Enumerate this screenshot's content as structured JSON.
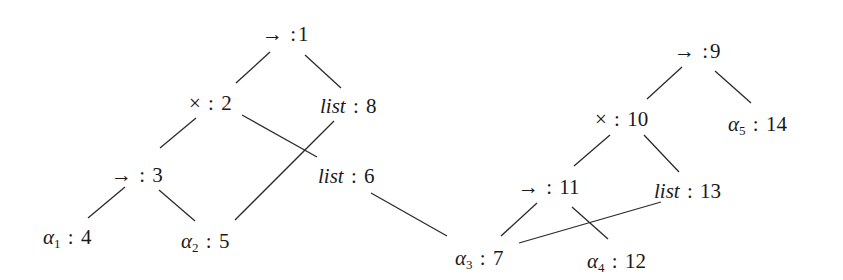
{
  "diagram": {
    "type": "type-graph",
    "nodes": [
      {
        "id": "1",
        "symbol": "→",
        "italic": false,
        "subscript": "",
        "sep": " :",
        "index": "1",
        "x": 262,
        "y": 22
      },
      {
        "id": "2",
        "symbol": "×",
        "italic": false,
        "subscript": "",
        "sep": " : ",
        "index": "2",
        "x": 189,
        "y": 91
      },
      {
        "id": "8",
        "symbol": "list",
        "italic": true,
        "subscript": "",
        "sep": " : ",
        "index": "8",
        "x": 320,
        "y": 94
      },
      {
        "id": "3",
        "symbol": "→",
        "italic": false,
        "subscript": "",
        "sep": " : ",
        "index": "3",
        "x": 111,
        "y": 163
      },
      {
        "id": "6",
        "symbol": "list",
        "italic": true,
        "subscript": "",
        "sep": " : ",
        "index": "6",
        "x": 318,
        "y": 164
      },
      {
        "id": "4",
        "symbol": "α",
        "italic": true,
        "subscript": "1",
        "sep": " : ",
        "index": "4",
        "x": 43,
        "y": 225
      },
      {
        "id": "5",
        "symbol": "α",
        "italic": true,
        "subscript": "2",
        "sep": " : ",
        "index": "5",
        "x": 181,
        "y": 229
      },
      {
        "id": "7",
        "symbol": "α",
        "italic": true,
        "subscript": "3",
        "sep": " : ",
        "index": "7",
        "x": 455,
        "y": 246
      },
      {
        "id": "9",
        "symbol": "→",
        "italic": false,
        "subscript": "",
        "sep": " :",
        "index": "9",
        "x": 674,
        "y": 39
      },
      {
        "id": "10",
        "symbol": "×",
        "italic": false,
        "subscript": "",
        "sep": " : ",
        "index": "10",
        "x": 595,
        "y": 107
      },
      {
        "id": "14",
        "symbol": "α",
        "italic": true,
        "subscript": "5",
        "sep": " : ",
        "index": "14",
        "x": 728,
        "y": 112
      },
      {
        "id": "11",
        "symbol": "→",
        "italic": false,
        "subscript": "",
        "sep": " : ",
        "index": "11",
        "x": 518,
        "y": 175
      },
      {
        "id": "13",
        "symbol": "list",
        "italic": true,
        "subscript": "",
        "sep": " : ",
        "index": "13",
        "x": 654,
        "y": 179
      },
      {
        "id": "12",
        "symbol": "α",
        "italic": true,
        "subscript": "4",
        "sep": " : ",
        "index": "12",
        "x": 587,
        "y": 249
      }
    ],
    "edges": [
      {
        "from": "1",
        "to": "2",
        "x1": 270,
        "y1": 52,
        "x2": 236,
        "y2": 83
      },
      {
        "from": "1",
        "to": "8",
        "x1": 305,
        "y1": 55,
        "x2": 341,
        "y2": 88
      },
      {
        "from": "2",
        "to": "3",
        "x1": 196,
        "y1": 118,
        "x2": 160,
        "y2": 148
      },
      {
        "from": "2",
        "to": "6",
        "x1": 242,
        "y1": 115,
        "x2": 317,
        "y2": 157
      },
      {
        "from": "8",
        "to": "5",
        "x1": 334,
        "y1": 121,
        "x2": 235,
        "y2": 220
      },
      {
        "from": "3",
        "to": "4",
        "x1": 125,
        "y1": 187,
        "x2": 88,
        "y2": 218
      },
      {
        "from": "3",
        "to": "5",
        "x1": 159,
        "y1": 190,
        "x2": 195,
        "y2": 221
      },
      {
        "from": "6",
        "to": "7",
        "x1": 371,
        "y1": 193,
        "x2": 447,
        "y2": 236
      },
      {
        "from": "9",
        "to": "10",
        "x1": 682,
        "y1": 67,
        "x2": 647,
        "y2": 99
      },
      {
        "from": "9",
        "to": "14",
        "x1": 715,
        "y1": 71,
        "x2": 751,
        "y2": 103
      },
      {
        "from": "10",
        "to": "11",
        "x1": 610,
        "y1": 135,
        "x2": 574,
        "y2": 166
      },
      {
        "from": "10",
        "to": "13",
        "x1": 644,
        "y1": 135,
        "x2": 679,
        "y2": 172
      },
      {
        "from": "11",
        "to": "7",
        "x1": 537,
        "y1": 203,
        "x2": 501,
        "y2": 236
      },
      {
        "from": "11",
        "to": "12",
        "x1": 572,
        "y1": 207,
        "x2": 608,
        "y2": 239
      },
      {
        "from": "13",
        "to": "7",
        "x1": 661,
        "y1": 202,
        "x2": 519,
        "y2": 243
      }
    ]
  }
}
